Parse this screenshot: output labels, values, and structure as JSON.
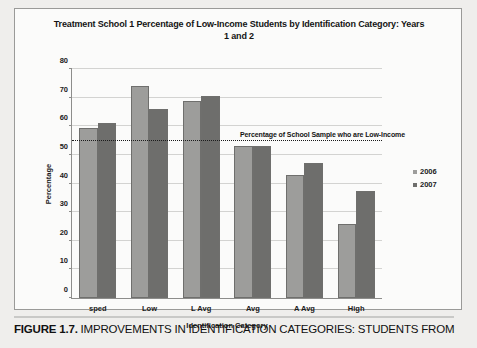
{
  "figure": {
    "caption_number": "FIGURE 1.7.",
    "caption_text": " IMPROVEMENTS IN IDENTIFICATION CATEGORIES: STUDENTS FROM"
  },
  "chart_data": {
    "type": "bar",
    "title": "Treatment School 1 Percentage of Low-Income Students by Identification Category: Years 1 and 2",
    "xlabel": "Identification Category",
    "ylabel": "Percentage",
    "categories": [
      "sped",
      "Low",
      "L Avg",
      "Avg",
      "A Avg",
      "High"
    ],
    "series": [
      {
        "name": "2006",
        "values": [
          59.5,
          74,
          69,
          53,
          43,
          26
        ],
        "color": "#9d9d9b"
      },
      {
        "name": "2007",
        "values": [
          61,
          66,
          70.5,
          53,
          47,
          37.5
        ],
        "color": "#6e6e6c"
      }
    ],
    "ylim": [
      0,
      80
    ],
    "yticks": [
      0,
      10,
      20,
      30,
      40,
      50,
      60,
      70,
      80
    ],
    "grid": true,
    "legend_position": "right",
    "annotations": [
      {
        "type": "reference-line",
        "label": "Percentage of School Sample who are Low-Income",
        "value": 55,
        "style": "dotted"
      }
    ]
  }
}
